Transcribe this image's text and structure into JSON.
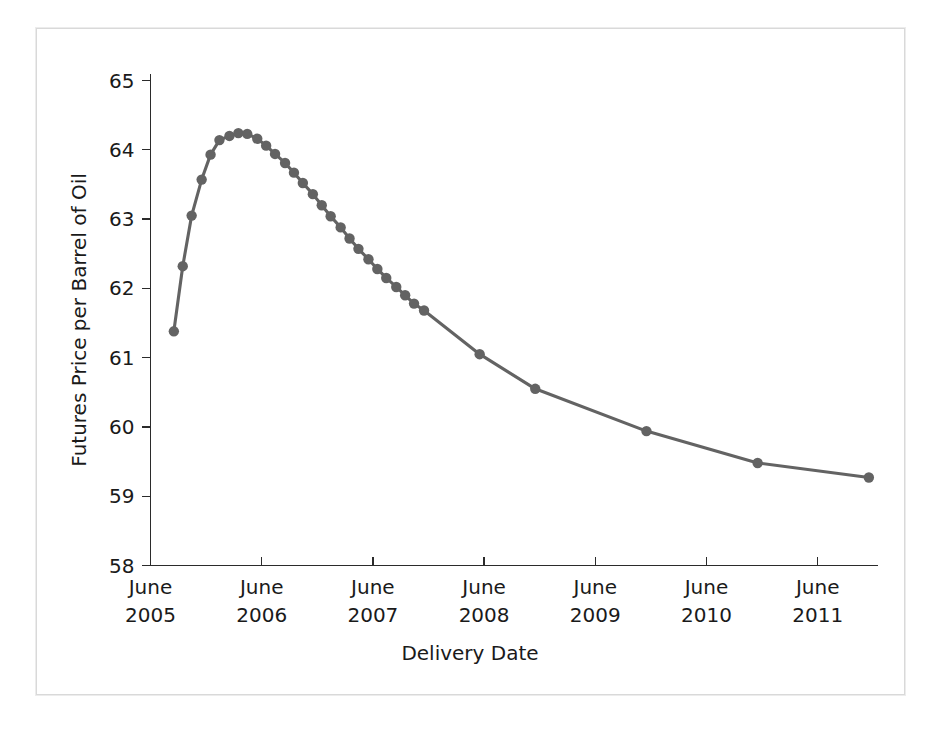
{
  "figure": {
    "background_color": "#ffffff",
    "frame_color": "#d9d9d9"
  },
  "chart_data": {
    "type": "line",
    "title": "",
    "xlabel": "Delivery Date",
    "ylabel": "Futures Price per Barrel of Oil",
    "series_color": "#636363",
    "marker": "circle",
    "grid": false,
    "legend": false,
    "ylim": [
      58,
      65
    ],
    "ytick_labels": [
      "58",
      "59",
      "60",
      "61",
      "62",
      "63",
      "64",
      "65"
    ],
    "yticks": [
      58,
      59,
      60,
      61,
      62,
      63,
      64,
      65
    ],
    "xtick_labels": [
      "June\n2005",
      "June\n2006",
      "June\n2007",
      "June\n2008",
      "June\n2009",
      "June\n2010",
      "June\n2011"
    ],
    "xticks_month": [
      "June",
      "June",
      "June",
      "June",
      "June",
      "June",
      "June"
    ],
    "xticks_year": [
      "2005",
      "2006",
      "2007",
      "2008",
      "2009",
      "2010",
      "2011"
    ],
    "xlim_years": [
      2005.42,
      2012.0
    ],
    "x_unit": "years since June 2005 (decimal)",
    "points": [
      {
        "x": 2005.63,
        "y": 61.38
      },
      {
        "x": 2005.71,
        "y": 62.32
      },
      {
        "x": 2005.79,
        "y": 63.05
      },
      {
        "x": 2005.88,
        "y": 63.57
      },
      {
        "x": 2005.96,
        "y": 63.93
      },
      {
        "x": 2006.04,
        "y": 64.14
      },
      {
        "x": 2006.13,
        "y": 64.2
      },
      {
        "x": 2006.21,
        "y": 64.24
      },
      {
        "x": 2006.29,
        "y": 64.23
      },
      {
        "x": 2006.38,
        "y": 64.16
      },
      {
        "x": 2006.46,
        "y": 64.06
      },
      {
        "x": 2006.54,
        "y": 63.94
      },
      {
        "x": 2006.63,
        "y": 63.81
      },
      {
        "x": 2006.71,
        "y": 63.67
      },
      {
        "x": 2006.79,
        "y": 63.52
      },
      {
        "x": 2006.88,
        "y": 63.36
      },
      {
        "x": 2006.96,
        "y": 63.2
      },
      {
        "x": 2007.04,
        "y": 63.04
      },
      {
        "x": 2007.13,
        "y": 62.88
      },
      {
        "x": 2007.21,
        "y": 62.72
      },
      {
        "x": 2007.29,
        "y": 62.57
      },
      {
        "x": 2007.38,
        "y": 62.42
      },
      {
        "x": 2007.46,
        "y": 62.28
      },
      {
        "x": 2007.54,
        "y": 62.15
      },
      {
        "x": 2007.63,
        "y": 62.02
      },
      {
        "x": 2007.71,
        "y": 61.9
      },
      {
        "x": 2007.79,
        "y": 61.78
      },
      {
        "x": 2007.88,
        "y": 61.68
      },
      {
        "x": 2008.38,
        "y": 61.05
      },
      {
        "x": 2008.88,
        "y": 60.55
      },
      {
        "x": 2009.88,
        "y": 59.94
      },
      {
        "x": 2010.88,
        "y": 59.48
      },
      {
        "x": 2011.88,
        "y": 59.27
      }
    ],
    "values": [
      61.38,
      62.32,
      63.05,
      63.57,
      63.93,
      64.14,
      64.2,
      64.24,
      64.23,
      64.16,
      64.06,
      63.94,
      63.81,
      63.67,
      63.52,
      63.36,
      63.2,
      63.04,
      62.88,
      62.72,
      62.57,
      62.42,
      62.28,
      62.15,
      62.02,
      61.9,
      61.78,
      61.68,
      61.05,
      60.55,
      59.94,
      59.48,
      59.27
    ],
    "peak_value": 64.24,
    "min_value": 59.27,
    "start_value": 61.38,
    "end_value": 59.27
  }
}
